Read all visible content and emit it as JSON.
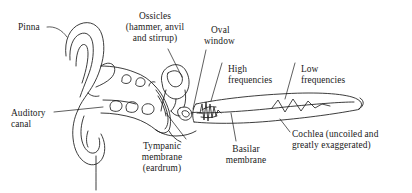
{
  "figure": {
    "name": "human-ear-anatomy-diagram",
    "background_color": "#ffffff",
    "ink_color": "#1a1a1a",
    "width": 412,
    "height": 193
  },
  "labels": {
    "pinna": "Pinna",
    "ossicles_l1": "Ossicles",
    "ossicles_l2": "(hammer, anvil",
    "ossicles_l3": "and stirrup)",
    "oval_l1": "Oval",
    "oval_l2": "window",
    "high_l1": "High",
    "high_l2": "frequencies",
    "low_l1": "Low",
    "low_l2": "frequencies",
    "auditory_l1": "Auditory",
    "auditory_l2": "canal",
    "tympanic_l1": "Tympanic",
    "tympanic_l2": "membrane",
    "tympanic_l3": "(eardrum)",
    "basilar_l1": "Basilar",
    "basilar_l2": "membrane",
    "cochlea_l1": "Cochlea (uncoiled and",
    "cochlea_l2": "greatly exaggerated)"
  }
}
